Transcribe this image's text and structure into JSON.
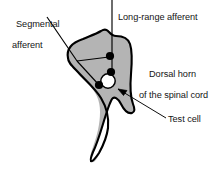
{
  "figure": {
    "name": "dorsal-horn-spinal-cord-diagram",
    "colors": {
      "outline": "#000000",
      "gray_fill": "#b4b4b4",
      "text": "#151515",
      "dot_fill": "#000000",
      "test_cell_fill": "#ffffff",
      "background": "#ffffff"
    },
    "labels": {
      "segmental_afferent": {
        "line1": "Segmental",
        "line2": "afferent"
      },
      "long_range_afferent": "Long-range afferent",
      "dorsal_horn": {
        "line1": "Dorsal horn",
        "line2": "of the spinal cord"
      },
      "test_cell": "Test cell"
    },
    "elements": {
      "dorsal_horn_shape": "dorsal-horn-gray-region",
      "synaptic_dots": [
        {
          "name": "long-range-afferent-terminal-upper",
          "cx": 110,
          "cy": 56,
          "r": 4.1,
          "fill": "#000000"
        },
        {
          "name": "long-range-afferent-terminal-lower",
          "cx": 111,
          "cy": 72,
          "r": 4.1,
          "fill": "#000000"
        },
        {
          "name": "segmental-afferent-terminal",
          "cx": 99,
          "cy": 85,
          "r": 4.1,
          "fill": "#000000"
        }
      ],
      "test_cell_circle": {
        "cx": 108,
        "cy": 81,
        "r": 7.2,
        "fill": "#ffffff",
        "stroke": "#000000"
      }
    }
  }
}
